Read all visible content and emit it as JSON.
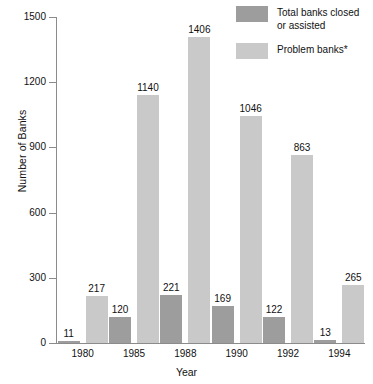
{
  "chart_data": {
    "type": "bar",
    "title": "",
    "xlabel": "Year",
    "ylabel": "Number of Banks",
    "categories": [
      "1980",
      "1985",
      "1988",
      "1990",
      "1992",
      "1994"
    ],
    "series": [
      {
        "name": "Total banks closed\nor assisted",
        "legend_label": "Total banks closed\nor assisted",
        "color": "#9d9d9d",
        "values": [
          11,
          120,
          221,
          169,
          122,
          13
        ]
      },
      {
        "name": "Problem banks*",
        "legend_label": "Problem banks*",
        "color": "#c9c9c9",
        "values": [
          217,
          1140,
          1406,
          1046,
          863,
          265
        ]
      }
    ],
    "ylim": [
      0,
      1500
    ],
    "yticks": [
      0,
      300,
      600,
      900,
      1200,
      1500
    ],
    "ytick_labels": [
      "0",
      "300",
      "600",
      "900",
      "1200",
      "1500"
    ],
    "grid": false,
    "legend_position": "top-right",
    "data_labels": true
  },
  "axes": {
    "y_title": "Number of Banks",
    "x_title": "Year"
  },
  "legend": {
    "items": [
      {
        "label": "Total banks closed\nor assisted",
        "color": "#9d9d9d"
      },
      {
        "label": "Problem banks*",
        "color": "#c9c9c9"
      }
    ]
  }
}
